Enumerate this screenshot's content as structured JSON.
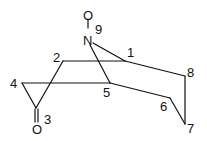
{
  "diagram": {
    "type": "chemical-structure",
    "atoms": [
      {
        "id": "O_N",
        "symbol": "O",
        "x": 88,
        "y": 15
      },
      {
        "id": "N9",
        "symbol": "N",
        "x": 88,
        "y": 40
      }
    ],
    "ring_labels": [
      {
        "text": "9",
        "x": 95,
        "y": 34
      },
      {
        "text": "1",
        "x": 127,
        "y": 57
      },
      {
        "text": "2",
        "x": 53,
        "y": 62
      },
      {
        "text": "8",
        "x": 187,
        "y": 77
      },
      {
        "text": "4",
        "x": 10,
        "y": 88
      },
      {
        "text": "5",
        "x": 103,
        "y": 97
      },
      {
        "text": "6",
        "x": 160,
        "y": 111
      },
      {
        "text": "3",
        "x": 44,
        "y": 124
      },
      {
        "text": "7",
        "x": 187,
        "y": 133
      }
    ],
    "carbonyl_oxygen": {
      "symbol": "O",
      "x": 32,
      "y": 134
    }
  }
}
